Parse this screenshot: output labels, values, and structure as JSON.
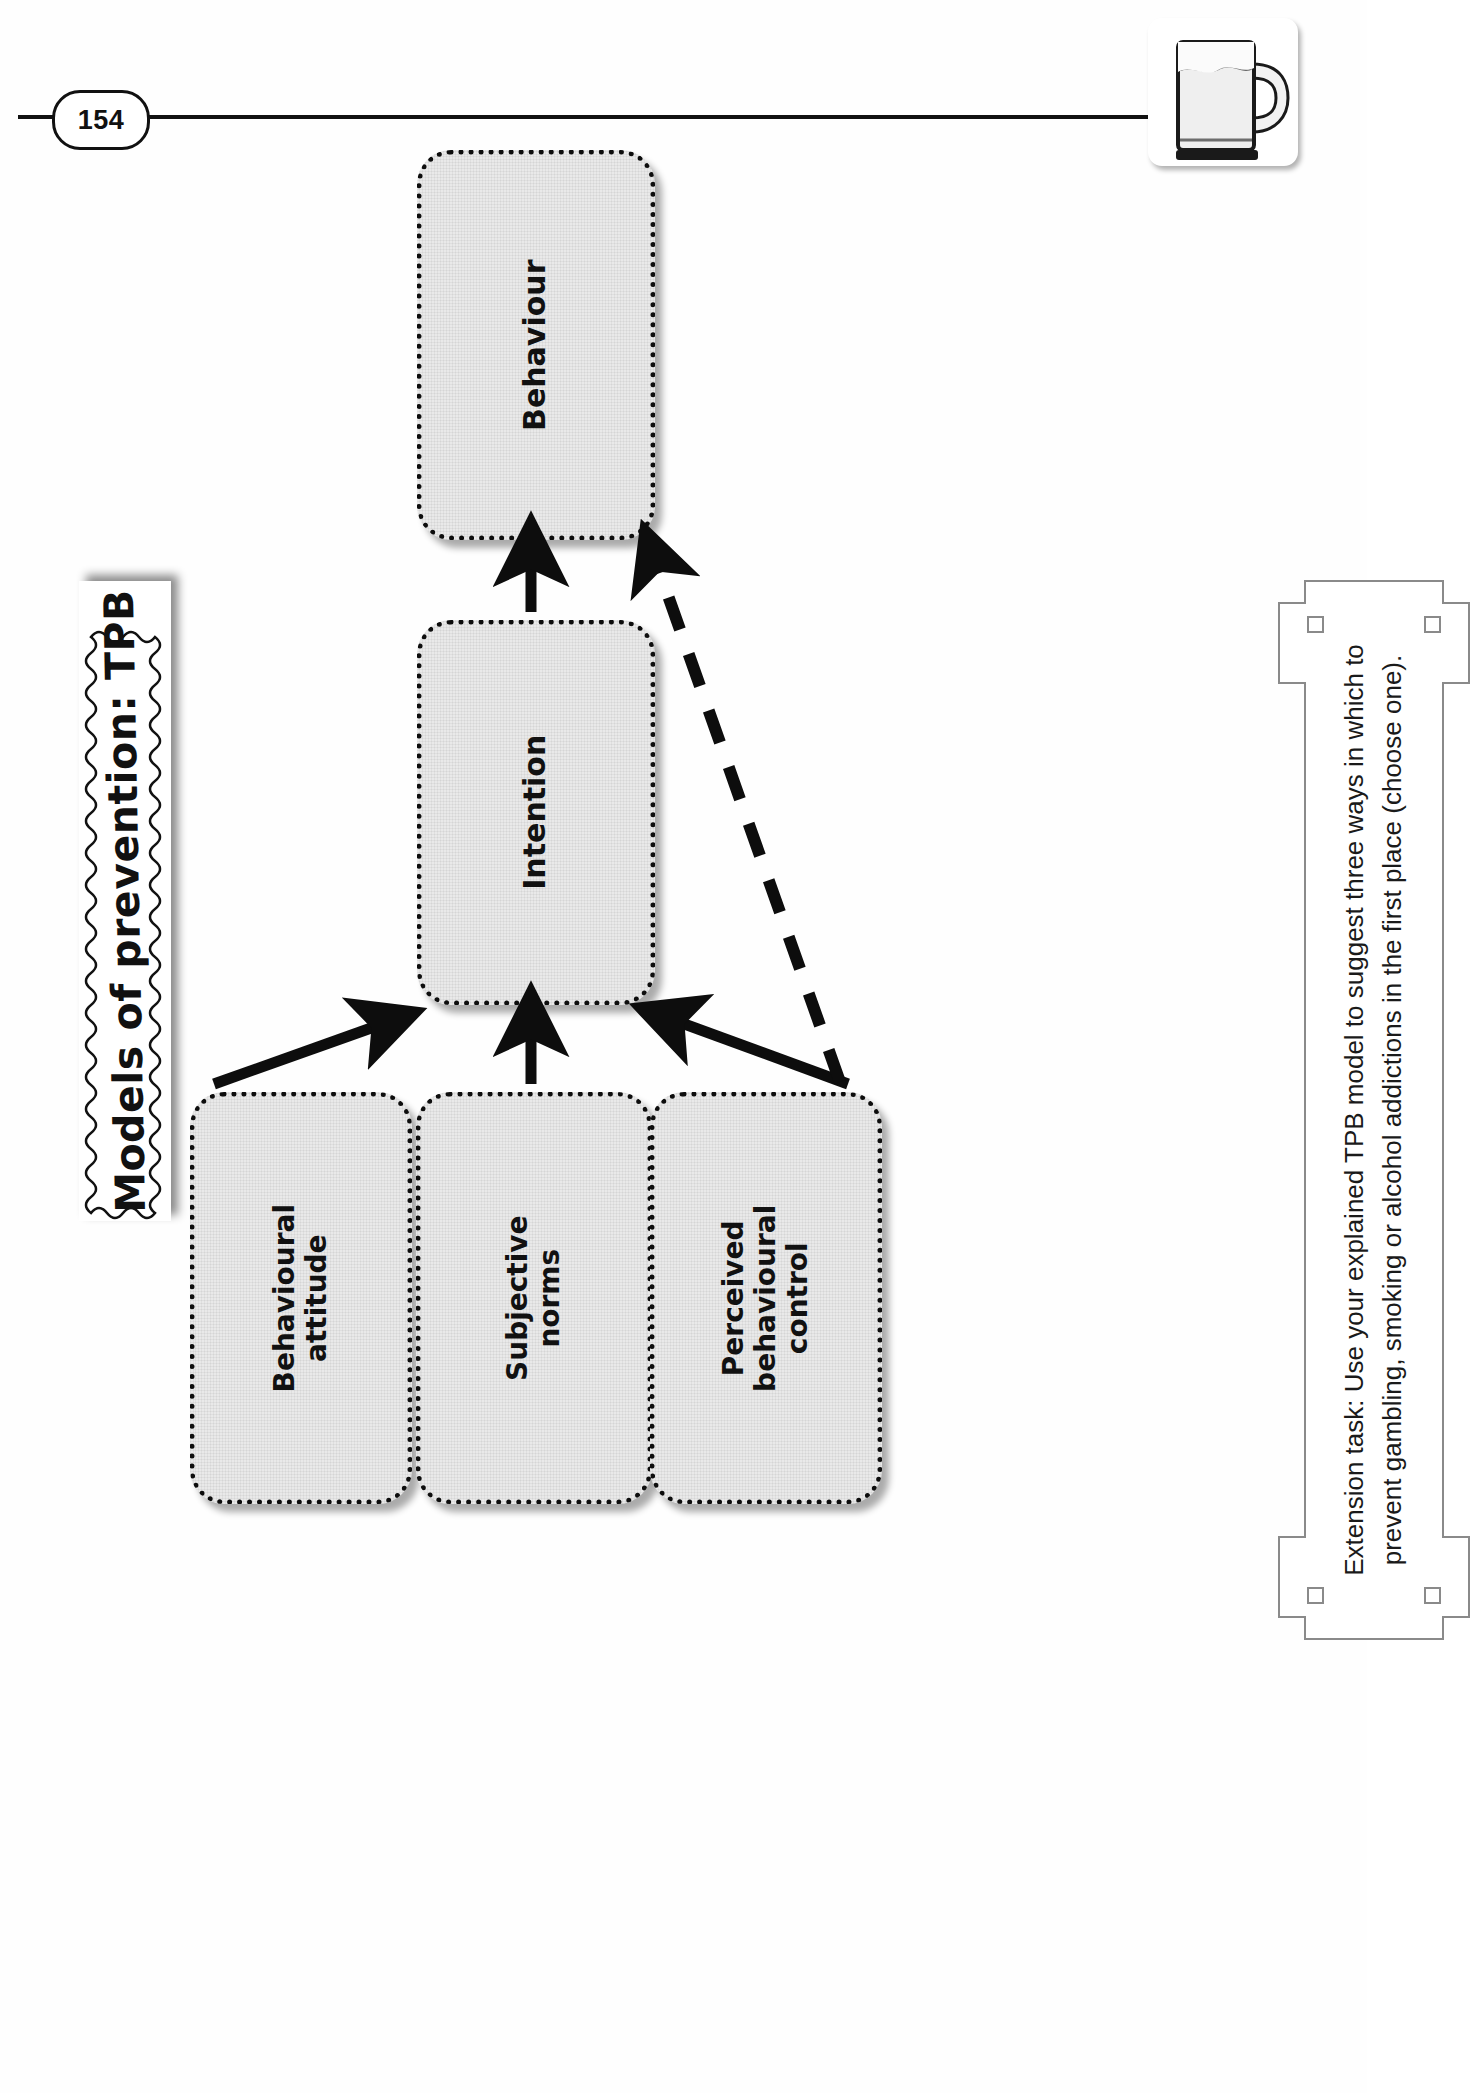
{
  "page": {
    "number": "154",
    "title": "Models of prevention: TPB",
    "corner_icon": "beer-mug-icon"
  },
  "diagram": {
    "type": "flow",
    "nodes": [
      {
        "id": "behaviour",
        "label": "Behaviour"
      },
      {
        "id": "intention",
        "label": "Intention"
      },
      {
        "id": "attitude",
        "label": "Behavioural attitude"
      },
      {
        "id": "norms",
        "label": "Subjective norms"
      },
      {
        "id": "control",
        "label": "Perceived behavioural\ncontrol"
      }
    ],
    "edges": [
      {
        "from": "intention",
        "to": "behaviour",
        "style": "solid"
      },
      {
        "from": "attitude",
        "to": "intention",
        "style": "solid"
      },
      {
        "from": "norms",
        "to": "intention",
        "style": "solid"
      },
      {
        "from": "control",
        "to": "intention",
        "style": "solid"
      },
      {
        "from": "control",
        "to": "behaviour",
        "style": "dashed"
      }
    ]
  },
  "extension": {
    "label": "Extension task: Use your explained TPB model to suggest three ways in which to prevent gambling, smoking or alcohol addictions in the first place (choose one)."
  },
  "colors": {
    "ink": "#111111",
    "node_fill": "#e9e9e9",
    "frame": "#8a8a8a"
  }
}
